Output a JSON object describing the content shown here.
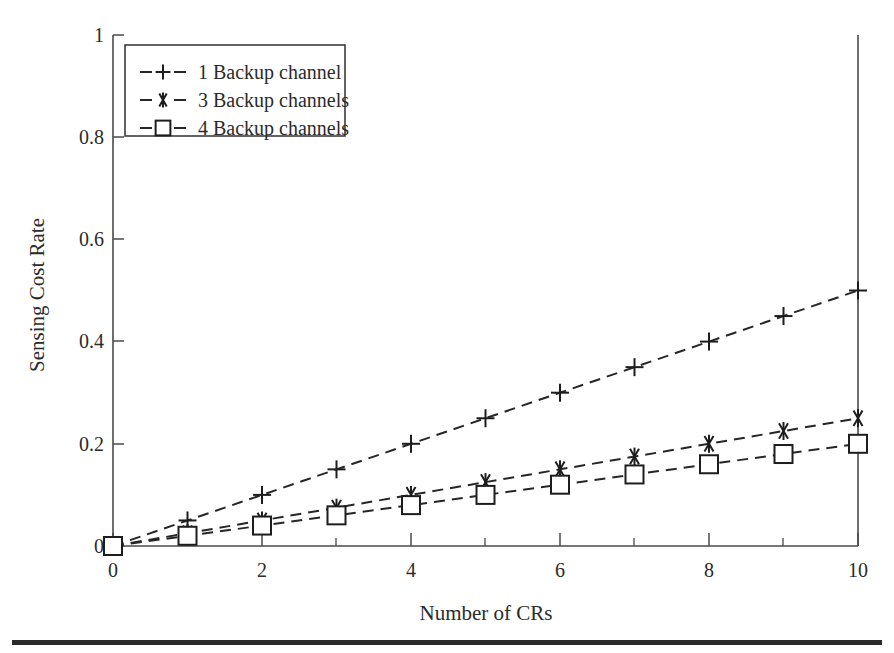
{
  "chart_data": {
    "type": "line",
    "title": "",
    "xlabel": "Number of CRs",
    "ylabel": "Sensing Cost Rate",
    "xlim": [
      0,
      10
    ],
    "ylim": [
      0,
      1
    ],
    "grid": false,
    "legend_position": "top-left",
    "x": [
      0,
      1,
      2,
      3,
      4,
      5,
      6,
      7,
      8,
      9,
      10
    ],
    "xticks": [
      0,
      2,
      4,
      6,
      8,
      10
    ],
    "xtick_labels": [
      "0",
      "2",
      "4",
      "6",
      "8",
      "10"
    ],
    "xticks_minor": [
      1,
      3,
      5,
      7,
      9
    ],
    "yticks": [
      0,
      0.2,
      0.4,
      0.6,
      0.8,
      1
    ],
    "ytick_labels": [
      "0",
      "0.2",
      "0.4",
      "0.6",
      "0.8",
      "1"
    ],
    "series": [
      {
        "name": "1 Backup channel",
        "marker": "plus",
        "linestyle": "dashed",
        "color": "#262626",
        "values": [
          0,
          0.05,
          0.1,
          0.15,
          0.2,
          0.25,
          0.3,
          0.35,
          0.4,
          0.45,
          0.5
        ]
      },
      {
        "name": "3 Backup channels",
        "marker": "asterisk",
        "linestyle": "dashed",
        "color": "#262626",
        "values": [
          0,
          0.025,
          0.05,
          0.075,
          0.1,
          0.125,
          0.15,
          0.175,
          0.2,
          0.225,
          0.25
        ]
      },
      {
        "name": "4 Backup channels",
        "marker": "square",
        "linestyle": "dashed",
        "color": "#262626",
        "values": [
          0,
          0.02,
          0.04,
          0.06,
          0.08,
          0.1,
          0.12,
          0.14,
          0.16,
          0.18,
          0.2
        ]
      }
    ]
  },
  "legend": {
    "entries": [
      {
        "label": "1 Backup channel",
        "marker": "plus"
      },
      {
        "label": "3 Backup channels",
        "marker": "asterisk"
      },
      {
        "label": "4 Backup channels",
        "marker": "square"
      }
    ]
  },
  "axes": {
    "x_title": "Number of CRs",
    "y_title": "Sensing Cost Rate",
    "x_tick_labels": [
      "0",
      "2",
      "4",
      "6",
      "8",
      "10"
    ],
    "y_tick_labels": [
      "0",
      "0.2",
      "0.4",
      "0.6",
      "0.8",
      "1"
    ]
  },
  "colors": {
    "background": "#ffffff",
    "ink": "#262626",
    "axis": "#4a4a4a",
    "rule": "#2a2a2a"
  }
}
